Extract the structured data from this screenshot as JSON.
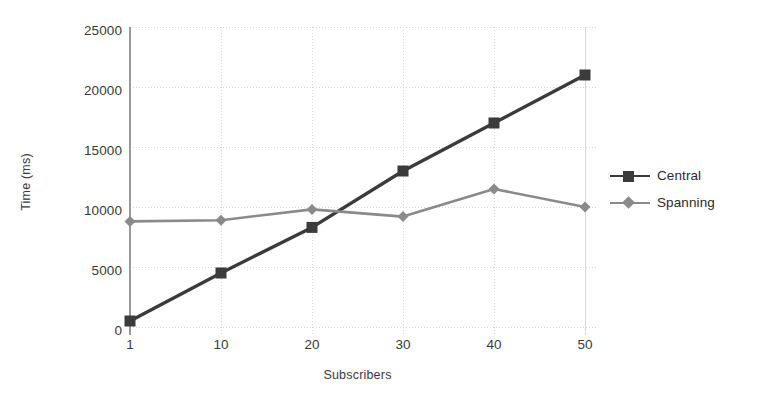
{
  "chart_data": {
    "type": "line",
    "title": "",
    "xlabel": "Subscribers",
    "ylabel": "Time (ms)",
    "x": [
      1,
      10,
      20,
      30,
      40,
      50
    ],
    "categories": [
      "1",
      "10",
      "20",
      "30",
      "40",
      "50"
    ],
    "series": [
      {
        "name": "Central",
        "values": [
          500,
          4500,
          8300,
          13000,
          17000,
          21000
        ],
        "color": "#3b3b3b",
        "marker": "square"
      },
      {
        "name": "Spanning",
        "values": [
          8800,
          8900,
          9800,
          9200,
          11500,
          10000
        ],
        "color": "#8a8a8a",
        "marker": "diamond"
      }
    ],
    "ylim": [
      0,
      25000
    ],
    "yticks": [
      0,
      5000,
      10000,
      15000,
      20000,
      25000
    ],
    "ytick_labels": [
      "0",
      "5000",
      "10000",
      "15000",
      "20000",
      "25000"
    ],
    "xtick_labels": [
      "1",
      "10",
      "20",
      "30",
      "40",
      "50"
    ],
    "grid": true,
    "grid_color": "#d9d9d9",
    "legend_position": "right",
    "axis_color": "#9a9a9a",
    "background": "#ffffff"
  },
  "legend": {
    "entries": [
      {
        "label": "Central"
      },
      {
        "label": "Spanning"
      }
    ]
  },
  "axes": {
    "x_title": "Subscribers",
    "y_title": "Time (ms)"
  }
}
